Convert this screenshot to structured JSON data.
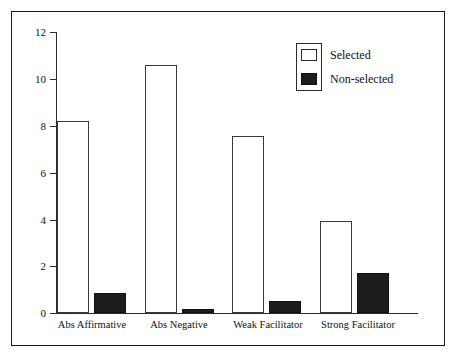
{
  "chart_data": {
    "type": "bar",
    "title": "",
    "xlabel": "",
    "ylabel": "",
    "ylim": [
      0,
      12
    ],
    "yticks": [
      0,
      2,
      4,
      6,
      8,
      10,
      12
    ],
    "ytick_labels": [
      "0",
      "2",
      "4",
      "6",
      "8",
      "10",
      "12"
    ],
    "grid": false,
    "legend_position": "top-right",
    "categories": [
      "Abs Affirmative",
      "Abs Negative",
      "Weak Facilitator",
      "Strong Facilitator"
    ],
    "series": [
      {
        "name": "Selected",
        "color": "#ffffff",
        "edge_color": "#3a3a3a",
        "values": [
          8.2,
          10.6,
          7.55,
          3.95
        ]
      },
      {
        "name": "Non-selected",
        "color": "#1c1c1c",
        "edge_color": "#111111",
        "values": [
          0.85,
          0.17,
          0.5,
          1.7
        ]
      }
    ]
  },
  "legend": {
    "entries": [
      {
        "label": "Selected",
        "swatch": "open-square"
      },
      {
        "label": "Non-selected",
        "swatch": "filled-square"
      }
    ]
  },
  "axis": {
    "y_ticks": [
      "12",
      "10",
      "8",
      "6",
      "4",
      "2",
      "0"
    ]
  }
}
